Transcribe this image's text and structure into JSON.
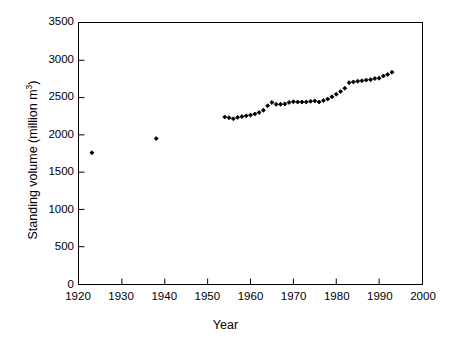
{
  "figure": {
    "background_color": "#ffffff",
    "axis_color": "#000000",
    "marker_color": "#000000",
    "marker_shape": "diamond"
  },
  "chart_data": {
    "type": "scatter",
    "title": "",
    "subtitle": "",
    "xlabel": "Year",
    "ylabel": "Standing volume (million m3)",
    "ylabel_text": "Standing volume (million m",
    "ylabel_exponent": "3",
    "ylabel_suffix": ")",
    "xlim": [
      1920,
      2000
    ],
    "ylim": [
      0,
      3500
    ],
    "xticks": [
      1920,
      1930,
      1940,
      1950,
      1960,
      1970,
      1980,
      1990,
      2000
    ],
    "xticklabels": [
      "1920",
      "1930",
      "1940",
      "1950",
      "1960",
      "1970",
      "1980",
      "1990",
      "2000"
    ],
    "yticks": [
      0,
      500,
      1000,
      1500,
      2000,
      2500,
      3000,
      3500
    ],
    "yticklabels": [
      "0",
      "500",
      "1000",
      "1500",
      "2000",
      "2500",
      "3000",
      "3500"
    ],
    "grid": false,
    "legend": false,
    "legend_position": "none",
    "tick_direction": "in",
    "series": [
      {
        "name": "Standing volume",
        "marker": "diamond",
        "color": "#000000",
        "x": [
          1923,
          1938,
          1954,
          1955,
          1956,
          1957,
          1958,
          1959,
          1960,
          1961,
          1962,
          1963,
          1964,
          1965,
          1966,
          1967,
          1968,
          1969,
          1970,
          1971,
          1972,
          1973,
          1974,
          1975,
          1976,
          1977,
          1978,
          1979,
          1980,
          1981,
          1982,
          1983,
          1984,
          1985,
          1986,
          1987,
          1988,
          1989,
          1990,
          1991,
          1992,
          1993
        ],
        "y": [
          1760,
          1950,
          2240,
          2230,
          2215,
          2235,
          2245,
          2255,
          2265,
          2280,
          2300,
          2330,
          2390,
          2435,
          2410,
          2410,
          2415,
          2435,
          2445,
          2440,
          2440,
          2440,
          2450,
          2455,
          2440,
          2460,
          2480,
          2510,
          2545,
          2580,
          2625,
          2700,
          2710,
          2720,
          2725,
          2735,
          2740,
          2755,
          2760,
          2790,
          2810,
          2840
        ]
      }
    ]
  }
}
